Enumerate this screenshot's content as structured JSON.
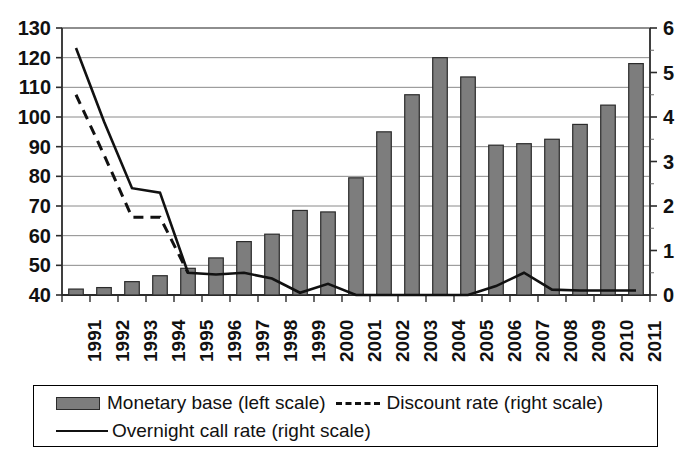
{
  "chart_data": {
    "type": "bar",
    "title": "",
    "subtitle": "",
    "xlabel": "",
    "ylabel": "",
    "ylabel_right": "",
    "categories": [
      "1991",
      "1992",
      "1993",
      "1994",
      "1995",
      "1996",
      "1997",
      "1998",
      "1999",
      "2000",
      "2001",
      "2002",
      "2003",
      "2004",
      "2005",
      "2006",
      "2007",
      "2008",
      "2009",
      "2010",
      "2011"
    ],
    "ylim": [
      40,
      130
    ],
    "yticks": [
      40,
      50,
      60,
      70,
      80,
      90,
      100,
      110,
      120,
      130
    ],
    "ylim_right": [
      0,
      6
    ],
    "yticks_right": [
      0,
      1,
      2,
      3,
      4,
      5,
      6
    ],
    "yticks_right_minor": [
      0.5,
      1.5,
      2.5,
      3.5,
      4.5,
      5.5
    ],
    "grid": true,
    "legend_position": "bottom",
    "series": [
      {
        "name": "Monetary base (left scale)",
        "type": "bar",
        "axis": "left",
        "color": "#7d7d7d",
        "edge_color": "#2b2b2b",
        "values": [
          42,
          42.5,
          44.5,
          46.5,
          49,
          52.5,
          58,
          60.5,
          68.5,
          68,
          79.5,
          95,
          107.5,
          120,
          113.5,
          90.5,
          91,
          92.5,
          97.5,
          104,
          118
        ]
      },
      {
        "name": "Discount rate (right scale)",
        "type": "line",
        "style": "dashed",
        "axis": "right",
        "color": "#111111",
        "values": [
          4.5,
          3.15,
          1.75,
          1.75,
          0.5,
          null,
          null,
          null,
          null,
          null,
          null,
          null,
          null,
          null,
          null,
          null,
          null,
          null,
          null,
          null,
          null
        ]
      },
      {
        "name": "Overnight call rate (right scale)",
        "type": "line",
        "style": "solid",
        "axis": "right",
        "color": "#111111",
        "values": [
          5.55,
          3.9,
          2.4,
          2.3,
          0.5,
          0.46,
          0.5,
          0.37,
          0.05,
          0.25,
          0.0,
          0.0,
          0.0,
          0.0,
          0.0,
          0.2,
          0.5,
          0.12,
          0.1,
          0.1,
          0.1
        ]
      }
    ]
  },
  "legend": {
    "items": [
      {
        "label": "Monetary base (left scale)",
        "marker": "bar-swatch"
      },
      {
        "label": "Discount rate (right scale)",
        "marker": "dashed-line-swatch"
      },
      {
        "label": "Overnight call rate (right scale)",
        "marker": "solid-line-swatch"
      }
    ]
  }
}
